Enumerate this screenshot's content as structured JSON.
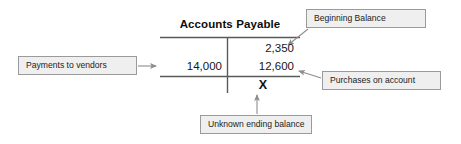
{
  "diagram": {
    "type": "t-account",
    "account": {
      "title": "Accounts Payable",
      "debit_entries": [
        "14,000"
      ],
      "credit_entries": [
        "2,350",
        "12,600"
      ],
      "ending_balance_marker": "X"
    },
    "callouts": [
      {
        "id": "beginning-balance",
        "label": "Beginning Balance",
        "points_to": "2,350"
      },
      {
        "id": "payments-to-vendors",
        "label": "Payments to vendors",
        "points_to": "14,000"
      },
      {
        "id": "purchases-on-account",
        "label": "Purchases on account",
        "points_to": "12,600"
      },
      {
        "id": "unknown-ending-balance",
        "label": "Unknown ending balance",
        "points_to": "X"
      }
    ],
    "colors": {
      "background": "#ffffff",
      "rule": "#5a5a5a",
      "text": "#161616",
      "callout_fill": "#efefef",
      "callout_border": "#9a9a9a",
      "arrow": "#8d8d8d"
    }
  }
}
